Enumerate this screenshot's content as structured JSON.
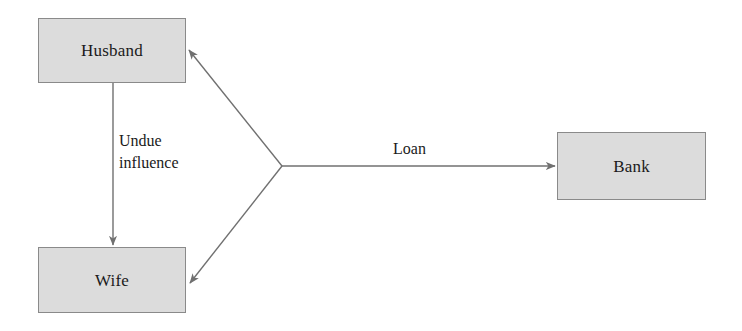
{
  "diagram": {
    "background_color": "#ffffff",
    "node_fill_color": "#dcdcdc",
    "node_border_color": "#8a8a8a",
    "edge_color": "#707070",
    "text_color": "#1a1a1a",
    "nodes": [
      {
        "id": "husband",
        "label": "Husband"
      },
      {
        "id": "wife",
        "label": "Wife"
      },
      {
        "id": "bank",
        "label": "Bank"
      }
    ],
    "edges": [
      {
        "id": "undue-influence",
        "from": "husband",
        "to": "wife",
        "label_line1": "Undue",
        "label_line2": "influence",
        "direction": "down",
        "arrowheads": 1
      },
      {
        "id": "loan",
        "from": "junction",
        "to": "bank",
        "label": "Loan",
        "direction": "right",
        "arrowheads": 1
      },
      {
        "id": "junction-to-husband",
        "from": "junction",
        "to": "husband",
        "label": "",
        "direction": "up-left",
        "arrowheads": 1
      },
      {
        "id": "junction-to-wife",
        "from": "junction",
        "to": "wife",
        "label": "",
        "direction": "down-left",
        "arrowheads": 1
      }
    ]
  }
}
